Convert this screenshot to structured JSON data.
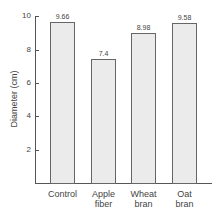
{
  "chart_data": {
    "type": "bar",
    "title": "",
    "xlabel": "",
    "ylabel": "Diameter (cm)",
    "categories": [
      "Control",
      "Apple fiber",
      "Wheat bran",
      "Oat bran"
    ],
    "category_lines": [
      [
        "Control"
      ],
      [
        "Apple",
        "fiber"
      ],
      [
        "Wheat",
        "bran"
      ],
      [
        "Oat",
        "bran"
      ]
    ],
    "values": [
      9.66,
      7.4,
      8.98,
      9.58
    ],
    "value_labels": [
      "9.66",
      "7.4",
      "8.98",
      "9.58"
    ],
    "ylim": [
      0,
      10
    ],
    "yticks": [
      2,
      4,
      6,
      8,
      10
    ],
    "ytick_labels": [
      "2",
      "4",
      "6",
      "8",
      "10"
    ],
    "grid": false,
    "legend": null,
    "bar_color": "#ebebeb",
    "bar_edge_color": "#666666"
  }
}
